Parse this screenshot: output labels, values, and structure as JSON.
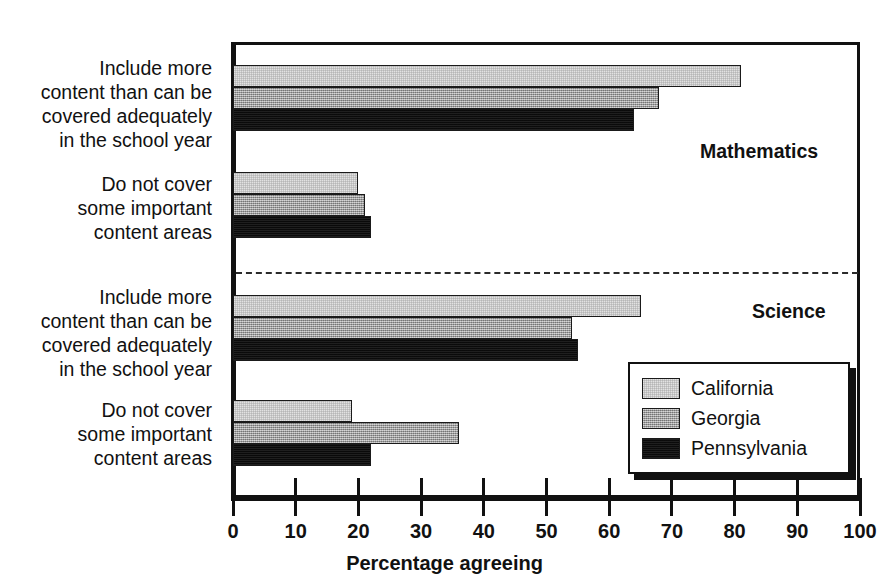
{
  "chart_data": {
    "type": "bar",
    "orientation": "horizontal",
    "title": "",
    "xlabel": "Percentage agreeing",
    "ylabel": "",
    "xlim": [
      0,
      100
    ],
    "xticks": [
      "0",
      "10",
      "20",
      "30",
      "40",
      "50",
      "60",
      "70",
      "80",
      "90",
      "100"
    ],
    "grid": false,
    "legend_position": "inside-right-lower",
    "panels": [
      {
        "label": "Mathematics",
        "categories": [
          "Include more\ncontent than can be\ncovered adequately\nin the school year",
          "Do not cover\nsome important\ncontent areas"
        ],
        "series": [
          {
            "name": "California",
            "values": [
              81,
              20
            ]
          },
          {
            "name": "Georgia",
            "values": [
              68,
              21
            ]
          },
          {
            "name": "Pennsylvania",
            "values": [
              64,
              22
            ]
          }
        ]
      },
      {
        "label": "Science",
        "categories": [
          "Include more\ncontent than can be\ncovered adequately\nin the school year",
          "Do not cover\nsome important\ncontent areas"
        ],
        "series": [
          {
            "name": "California",
            "values": [
              65,
              19
            ]
          },
          {
            "name": "Georgia",
            "values": [
              54,
              36
            ]
          },
          {
            "name": "Pennsylvania",
            "values": [
              55,
              22
            ]
          }
        ]
      }
    ],
    "legend": [
      {
        "name": "California",
        "color": "#e2e2e2"
      },
      {
        "name": "Georgia",
        "color": "#9c9c9c"
      },
      {
        "name": "Pennsylvania",
        "color": "#111111"
      }
    ]
  },
  "labels": {
    "cat_math_include": "Include more\ncontent than can be\ncovered adequately\nin the school year",
    "cat_math_donot": "Do not cover\nsome important\ncontent areas",
    "cat_sci_include": "Include more\ncontent than can be\ncovered adequately\nin the school year",
    "cat_sci_donot": "Do not cover\nsome important\ncontent areas",
    "section_math": "Mathematics",
    "section_sci": "Science",
    "xtitle": "Percentage agreeing",
    "legend_ca": "California",
    "legend_ga": "Georgia",
    "legend_pa": "Pennsylvania"
  },
  "ticks": {
    "t0": "0",
    "t1": "10",
    "t2": "20",
    "t3": "30",
    "t4": "40",
    "t5": "50",
    "t6": "60",
    "t7": "70",
    "t8": "80",
    "t9": "90",
    "t10": "100"
  }
}
